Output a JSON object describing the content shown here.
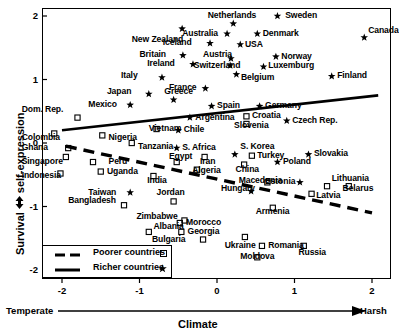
{
  "chart_data": {
    "type": "scatter",
    "title": "",
    "xlabel": "Climate",
    "ylabel": "Survival / self-expression",
    "ylabel_full": "Survival ▲▼ self-expression",
    "xlim": [
      -2.6,
      2.25
    ],
    "ylim": [
      -2.25,
      2.3
    ],
    "xticks": [
      -2,
      -1,
      0,
      1,
      2
    ],
    "yticks": [
      2,
      1,
      0,
      -1,
      -2
    ],
    "xtick_labels": [
      "-2",
      "-1",
      "0",
      "1",
      "2"
    ],
    "ytick_labels": [
      "2",
      "1",
      "0",
      "-1",
      "-2"
    ],
    "grid": false,
    "x_axis_left_word": "Temperate",
    "x_axis_right_word": "Harsh",
    "legend_position": "bottom-left",
    "legend": [
      {
        "label": "Poorer countries",
        "marker": "square-open",
        "line": "dashed",
        "marker_glyph": "▫"
      },
      {
        "label": "Richer countries",
        "marker": "star",
        "line": "solid",
        "marker_glyph": "★"
      }
    ],
    "series": [
      {
        "name": "Richer countries",
        "marker": "star",
        "points": [
          {
            "label": "New Zealand",
            "x": -0.45,
            "y": 1.8,
            "lx": -1.1,
            "ly": 1.62
          },
          {
            "label": "Sweden",
            "x": 0.78,
            "y": 2.0,
            "lx": 0.88,
            "ly": 2.0
          },
          {
            "label": "Netherlands",
            "x": 0.21,
            "y": 1.88,
            "lx": -0.12,
            "ly": 2.0
          },
          {
            "label": "Australia",
            "x": 0.13,
            "y": 1.72,
            "lx": -0.45,
            "ly": 1.72
          },
          {
            "label": "Denmark",
            "x": 0.52,
            "y": 1.72,
            "lx": 0.59,
            "ly": 1.72
          },
          {
            "label": "Canada",
            "x": 1.9,
            "y": 1.66,
            "lx": 1.95,
            "ly": 1.77
          },
          {
            "label": "Iceland",
            "x": -0.09,
            "y": 1.57,
            "lx": -0.7,
            "ly": 1.57
          },
          {
            "label": "USA",
            "x": 0.3,
            "y": 1.55,
            "lx": 0.36,
            "ly": 1.55
          },
          {
            "label": "Britain",
            "x": -0.44,
            "y": 1.38,
            "lx": -1.0,
            "ly": 1.38
          },
          {
            "label": "Austria",
            "x": 0.18,
            "y": 1.33,
            "lx": -0.18,
            "ly": 1.38
          },
          {
            "label": "Norway",
            "x": 0.76,
            "y": 1.36,
            "lx": 0.83,
            "ly": 1.36
          },
          {
            "label": "Ireland",
            "x": -0.31,
            "y": 1.24,
            "lx": -0.9,
            "ly": 1.24
          },
          {
            "label": "Switzerland",
            "x": 0.17,
            "y": 1.22,
            "lx": -0.3,
            "ly": 1.22
          },
          {
            "label": "Luxemburg",
            "x": 0.6,
            "y": 1.2,
            "lx": 0.66,
            "ly": 1.22
          },
          {
            "label": "Italy",
            "x": -0.71,
            "y": 1.03,
            "lx": -1.24,
            "ly": 1.05
          },
          {
            "label": "Belgium",
            "x": 0.25,
            "y": 1.08,
            "lx": 0.31,
            "ly": 1.03
          },
          {
            "label": "Finland",
            "x": 1.48,
            "y": 1.05,
            "lx": 1.55,
            "ly": 1.05
          },
          {
            "label": "Japan",
            "x": -0.88,
            "y": 0.77,
            "lx": -1.42,
            "ly": 0.8
          },
          {
            "label": "Greece",
            "x": -0.56,
            "y": 0.68,
            "lx": -0.68,
            "ly": 0.8
          },
          {
            "label": "France",
            "x": -0.15,
            "y": 0.86,
            "lx": -0.62,
            "ly": 0.86
          },
          {
            "label": "Mexico",
            "x": -1.12,
            "y": 0.6,
            "lx": -1.66,
            "ly": 0.6
          },
          {
            "label": "Spain",
            "x": -0.07,
            "y": 0.58,
            "lx": 0.0,
            "ly": 0.58
          },
          {
            "label": "Germany",
            "x": 0.55,
            "y": 0.58,
            "lx": 0.62,
            "ly": 0.58
          },
          {
            "label": "Argentina",
            "x": -0.35,
            "y": 0.4,
            "lx": -0.28,
            "ly": 0.4
          },
          {
            "label": "Czech Rep.",
            "x": 0.9,
            "y": 0.35,
            "lx": 0.97,
            "ly": 0.35
          },
          {
            "label": "Chile",
            "x": -0.5,
            "y": 0.2,
            "lx": -0.43,
            "ly": 0.2
          },
          {
            "label": "S. Africa",
            "x": -0.52,
            "y": -0.08,
            "lx": -0.45,
            "ly": -0.08
          },
          {
            "label": "S. Korea",
            "x": 0.23,
            "y": -0.18,
            "lx": 0.3,
            "ly": -0.06
          },
          {
            "label": "Slovakia",
            "x": 1.18,
            "y": -0.18,
            "lx": 1.25,
            "ly": -0.18
          },
          {
            "label": "Poland",
            "x": 0.78,
            "y": -0.3,
            "lx": 0.85,
            "ly": -0.3
          },
          {
            "label": "Taiwan",
            "x": -1.12,
            "y": -0.78,
            "lx": -1.66,
            "ly": -0.78
          },
          {
            "label": "Hungary",
            "x": 0.44,
            "y": -0.76,
            "lx": 0.05,
            "ly": -0.72
          },
          {
            "label": "Estonia",
            "x": 1.07,
            "y": -0.62,
            "lx": 0.62,
            "ly": -0.62
          }
        ]
      },
      {
        "name": "Poorer countries",
        "marker": "square-open",
        "points": [
          {
            "label": "Dom. Rep.",
            "x": -1.8,
            "y": 0.4,
            "lx": -2.52,
            "ly": 0.52
          },
          {
            "label": "Vietnam",
            "x": -0.78,
            "y": 0.22,
            "lx": -0.88,
            "ly": 0.22
          },
          {
            "label": "Colombia",
            "x": -2.1,
            "y": 0.15,
            "lx": -2.52,
            "ly": 0.08
          },
          {
            "label": "Nigeria",
            "x": -1.48,
            "y": 0.12,
            "lx": -1.4,
            "ly": 0.08
          },
          {
            "label": "Ghana",
            "x": -1.92,
            "y": -0.08,
            "lx": -2.52,
            "ly": -0.08
          },
          {
            "label": "Tanzania",
            "x": -1.1,
            "y": 0.0,
            "lx": -1.02,
            "ly": -0.06
          },
          {
            "label": "Croatia",
            "x": 0.38,
            "y": 0.42,
            "lx": 0.45,
            "ly": 0.42
          },
          {
            "label": "Slovenia",
            "x": 0.38,
            "y": 0.3,
            "lx": 0.22,
            "ly": 0.26
          },
          {
            "label": "Singapore",
            "x": -1.95,
            "y": -0.22,
            "lx": -2.52,
            "ly": -0.3
          },
          {
            "label": "Peru",
            "x": -1.6,
            "y": -0.3,
            "lx": -1.4,
            "ly": -0.3
          },
          {
            "label": "Egypt",
            "x": -0.52,
            "y": -0.3,
            "lx": -0.62,
            "ly": -0.22
          },
          {
            "label": "Indonesia",
            "x": -2.02,
            "y": -0.48,
            "lx": -2.52,
            "ly": -0.52
          },
          {
            "label": "Uganda",
            "x": -1.5,
            "y": -0.45,
            "lx": -1.42,
            "ly": -0.45
          },
          {
            "label": "India",
            "x": -0.82,
            "y": -0.52,
            "lx": -0.9,
            "ly": -0.6
          },
          {
            "label": "Iran",
            "x": -0.16,
            "y": -0.22,
            "lx": -0.22,
            "ly": -0.3
          },
          {
            "label": "Turkey",
            "x": 0.45,
            "y": -0.2,
            "lx": 0.52,
            "ly": -0.2
          },
          {
            "label": "China",
            "x": 0.35,
            "y": -0.34,
            "lx": 0.24,
            "ly": -0.42
          },
          {
            "label": "Algeria",
            "x": -0.26,
            "y": -0.42,
            "lx": -0.32,
            "ly": -0.44
          },
          {
            "label": "Bangladesh",
            "x": -1.2,
            "y": -0.98,
            "lx": -1.92,
            "ly": -0.92
          },
          {
            "label": "Jordan",
            "x": -0.56,
            "y": -0.92,
            "lx": -0.78,
            "ly": -0.78
          },
          {
            "label": "Macedonia",
            "x": 0.65,
            "y": -0.62,
            "lx": 0.28,
            "ly": -0.6
          },
          {
            "label": "Lithuania",
            "x": 1.42,
            "y": -0.68,
            "lx": 1.48,
            "ly": -0.56
          },
          {
            "label": "Belarus",
            "x": 1.7,
            "y": -0.68,
            "lx": 1.62,
            "ly": -0.72
          },
          {
            "label": "Zimbabwe",
            "x": -0.42,
            "y": -1.22,
            "lx": -1.04,
            "ly": -1.16
          },
          {
            "label": "Morocco",
            "x": -0.48,
            "y": -1.26,
            "lx": -0.4,
            "ly": -1.26
          },
          {
            "label": "Latvia",
            "x": 1.22,
            "y": -0.8,
            "lx": 1.28,
            "ly": -0.84
          },
          {
            "label": "Albania",
            "x": -0.88,
            "y": -1.4,
            "lx": -0.82,
            "ly": -1.32
          },
          {
            "label": "Georgia",
            "x": -0.46,
            "y": -1.4,
            "lx": -0.38,
            "ly": -1.4
          },
          {
            "label": "Armenia",
            "x": 0.72,
            "y": -1.02,
            "lx": 0.5,
            "ly": -1.08
          },
          {
            "label": "Bulgaria",
            "x": -0.18,
            "y": -1.52,
            "lx": -0.84,
            "ly": -1.52
          },
          {
            "label": "Ukraine",
            "x": 0.36,
            "y": -1.48,
            "lx": 0.1,
            "ly": -1.62
          },
          {
            "label": "Romania",
            "x": 0.58,
            "y": -1.62,
            "lx": 0.66,
            "ly": -1.62
          },
          {
            "label": "Russia",
            "x": 1.12,
            "y": -1.62,
            "lx": 1.05,
            "ly": -1.74
          },
          {
            "label": "Moldova",
            "x": 0.52,
            "y": -1.8,
            "lx": 0.3,
            "ly": -1.8
          }
        ]
      }
    ],
    "trendlines": [
      {
        "name": "Richer countries",
        "style": "solid",
        "x0": -2.0,
        "y0": 0.2,
        "x1": 2.08,
        "y1": 0.75
      },
      {
        "name": "Poorer countries",
        "style": "dashed",
        "x0": -1.95,
        "y0": -0.05,
        "x1": 2.0,
        "y1": -1.1
      }
    ]
  }
}
